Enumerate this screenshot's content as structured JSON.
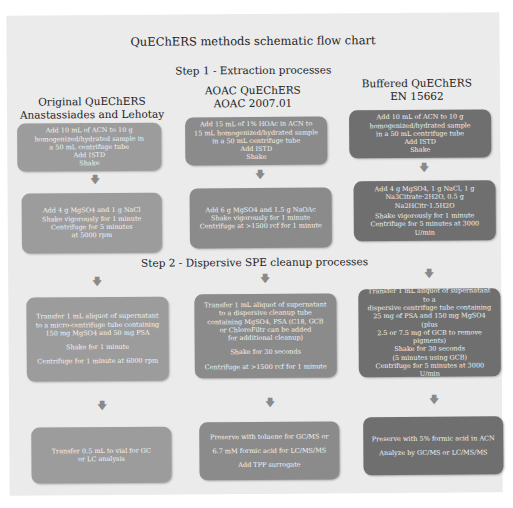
{
  "title": "QuEChERS methods schematic flow chart",
  "step1_label": "Step 1 - Extraction processes",
  "step2_label": "Step 2 - Dispersive SPE cleanup processes",
  "colors": {
    "background": "#ebebeb",
    "original_boxes": "#9c9c9c",
    "aoac_boxes": "#8b8b8b",
    "buffered_boxes": "#6f6f6f"
  },
  "columns": [
    {
      "heading_line1": "Original QuEChERS",
      "heading_line2": "Anastassiades and Lehotay 2003",
      "extraction": [
        "Add 10 mL of ACN to 10 g",
        "homogenized/hydrated sample in",
        "a 50 mL centrifuge tube",
        "Add ISTD",
        "Shake"
      ],
      "salts": [
        "Add 4 g MgSO4 and 1 g NaCl",
        "Shake vigorously for 1 minute",
        "Centrifuge for 5 minutes",
        "at 5000 rpm"
      ],
      "cleanup": [
        "Transfer 1 mL aliquot of supernatant",
        "to a micro-centrifuge tube containing",
        "150 mg MgSO4 and 50 mg PSA",
        "",
        "Shake for 1 minute",
        "",
        "Centrifuge for 1 minute at 6000 rpm"
      ],
      "final": [
        "Transfer 0.5 mL to vial for GC",
        "or LC analysis"
      ]
    },
    {
      "heading_line1": "AOAC QuEChERS",
      "heading_line2": "AOAC 2007.01",
      "extraction": [
        "Add 15 mL of 1% HOAc in ACN to",
        "15 mL homogenized/hydrated sample",
        "in a 50 mL centrifuge tube",
        "Add ISTD",
        "Shake"
      ],
      "salts": [
        "Add 6 g MgSO4 and 1.5 g NaOAc",
        "Shake vigorously for 1 minute",
        "Centrifuge at >1500 rcf for 1 minute"
      ],
      "cleanup": [
        "Transfer 1 mL aliquot of supernatant",
        "to a dispersive cleanup tube",
        "containing MgSO4, PSA (C18, GCB",
        "or ChloroFiltr can be added",
        "for additional cleanup)",
        "",
        "Shake for 30 seconds",
        "",
        "Centrifuge at >1500 rcf for 1 minute"
      ],
      "final": [
        "Preserve with toluene for GC/MS or",
        "",
        "6.7 mM formic acid for LC/MS/MS",
        "",
        "Add TPP surrogate"
      ]
    },
    {
      "heading_line1": "Buffered QuEChERS",
      "heading_line2": "EN 15662",
      "extraction": [
        "Add 10 mL of ACN to 10 g",
        "homogenized/hydrated sample",
        "in a 50 mL centrifuge tube",
        "Add ISTD",
        "Shake"
      ],
      "salts": [
        "Add 4 g MgSO4, 1 g NaCl, 1 g",
        "Na3Citrate·2H2O, 0.5 g",
        "Na2HCitr·1.5H2O",
        "",
        "Shake vigorously for 1 minute",
        "Centrifuge for 5 minutes at 3000 U/min"
      ],
      "cleanup": [
        "Transfer 1 mL aliquot of supernatant to a",
        "dispersive centrifuge tube containing",
        "25 mg of PSA and 150 mg MgSO4 (plus",
        "2.5 or 7.5 mg of GCB to remove pigments)",
        "",
        "Shake for 30 seconds",
        "",
        "(5 minutes using GCB)",
        "Centrifuge for 5 minutes at 3000 U/min"
      ],
      "final": [
        "Preserve with 5% formic acid in ACN",
        "",
        "Analyze by GC/MS or LC/MS/MS"
      ]
    }
  ],
  "arrow_glyph": "🡇"
}
